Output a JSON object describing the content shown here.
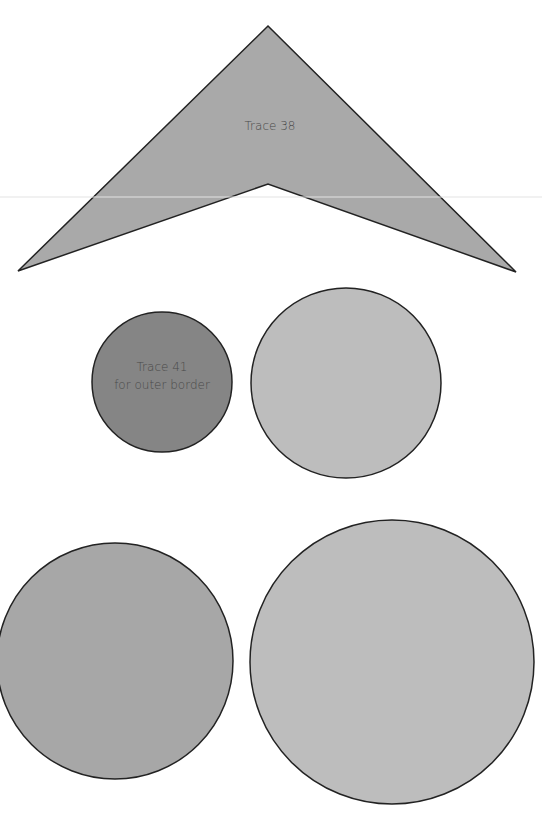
{
  "canvas": {
    "width": 542,
    "height": 813,
    "background": "#ffffff"
  },
  "guide_line": {
    "y": 197,
    "color": "#e3e3e3"
  },
  "shapes": [
    {
      "id": "trace-38",
      "type": "chevron-polygon",
      "label": "Trace 38",
      "points": "268,26 516,272 268,184 18,271",
      "fill": "#a9a9a9",
      "stroke": "#222222",
      "label_pos": [
        270,
        130
      ]
    },
    {
      "id": "trace-41",
      "type": "circle",
      "label_lines": [
        "Trace 41",
        "for outer border"
      ],
      "cx": 162,
      "cy": 382,
      "r": 70,
      "fill": "#858585",
      "stroke": "#222222"
    },
    {
      "id": "circle-2",
      "type": "circle",
      "cx": 346,
      "cy": 383,
      "r": 95,
      "fill": "#bdbdbd",
      "stroke": "#222222"
    },
    {
      "id": "circle-3",
      "type": "circle",
      "cx": 115,
      "cy": 661,
      "r": 118,
      "fill": "#a7a7a7",
      "stroke": "#222222"
    },
    {
      "id": "circle-4",
      "type": "circle",
      "cx": 392,
      "cy": 662,
      "r": 142,
      "fill": "#bdbdbd",
      "stroke": "#222222"
    }
  ]
}
